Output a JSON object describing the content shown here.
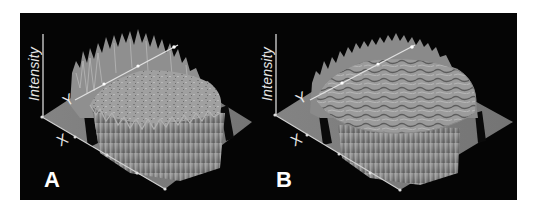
{
  "figure": {
    "background": "#050505",
    "page_background": "#ffffff",
    "surface_color": "#8c8c8c",
    "panels": [
      {
        "label": "A",
        "axis_labels": {
          "z": "Intensity",
          "y": "Y",
          "x": "X"
        },
        "description": "3D intensity surface: raised plateau with tall jagged peaks along the rim, relatively flat top"
      },
      {
        "label": "B",
        "axis_labels": {
          "z": "Intensity",
          "y": "Y",
          "x": "X"
        },
        "description": "3D intensity surface: raised plateau with strongly textured/wrinkled top and lower rim peaks"
      }
    ]
  }
}
